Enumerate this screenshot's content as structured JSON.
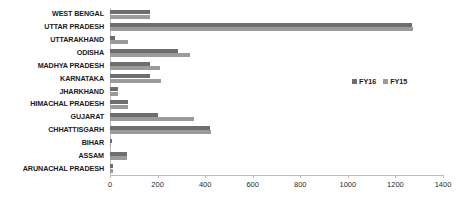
{
  "chart_data": {
    "type": "bar",
    "orientation": "horizontal",
    "title": "",
    "xlabel": "",
    "ylabel": "",
    "xlim": [
      0,
      1400
    ],
    "xticks": [
      0,
      200,
      400,
      600,
      800,
      1000,
      1200,
      1400
    ],
    "xtick_labels": [
      "0",
      "200",
      "400",
      "600",
      "800",
      "1000",
      "1200",
      "1400"
    ],
    "grid": false,
    "legend_position": "right-middle",
    "categories": [
      "WEST BENGAL",
      "UTTAR PRADESH",
      "UTTARAKHAND",
      "ODISHA",
      "MADHYA PRADESH",
      "KARNATAKA",
      "JHARKHAND",
      "HIMACHAL PRADESH",
      "GUJARAT",
      "CHHATTISGARH",
      "BIHAR",
      "ASSAM",
      "ARUNACHAL PRADESH"
    ],
    "series": [
      {
        "name": "FY16",
        "color": "#6e6e6e",
        "values": [
          170,
          1270,
          20,
          285,
          170,
          170,
          35,
          75,
          200,
          420,
          8,
          70,
          12
        ]
      },
      {
        "name": "FY15",
        "color": "#9b9b9b",
        "values": [
          170,
          1275,
          75,
          335,
          210,
          215,
          35,
          75,
          355,
          425,
          5,
          70,
          14
        ]
      }
    ]
  },
  "legend": {
    "items": [
      {
        "label": "FY16",
        "color": "#6e6e6e"
      },
      {
        "label": "FY15",
        "color": "#9b9b9b"
      }
    ]
  }
}
